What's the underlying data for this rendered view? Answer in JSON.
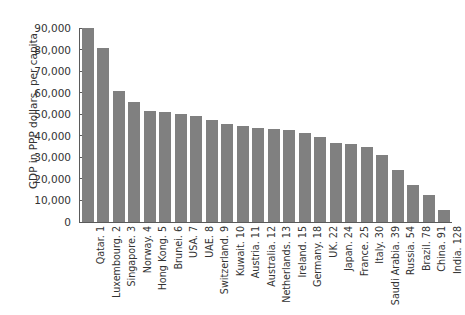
{
  "chart_data": {
    "type": "bar",
    "title": "",
    "subtitle": "",
    "xlabel": "",
    "ylabel": "GDP in PPP dollars, per capita",
    "ylim": [
      0,
      90000
    ],
    "yticks": [
      0,
      10000,
      20000,
      30000,
      40000,
      50000,
      60000,
      70000,
      80000,
      90000
    ],
    "ytick_labels": [
      "0",
      "10,000",
      "20,000",
      "30,000",
      "40,000",
      "50,000",
      "60,000",
      "70,000",
      "80,000",
      "90,000"
    ],
    "grid": false,
    "legend": null,
    "bar_color": "#808080",
    "background_color": "#ffffff",
    "axis_color": "#5a5a5a",
    "categories": [
      "Qatar. 1",
      "Luxembourg. 2",
      "Singapore. 3",
      "Norway. 4",
      "Hong Kong. 5",
      "Brunei. 6",
      "USA. 7",
      "UAE. 8",
      "Switzerland. 9",
      "Kuwait. 10",
      "Austria. 11",
      "Australia. 12",
      "Netherlands. 13",
      "Ireland. 15",
      "Germany. 18",
      "UK. 22",
      "Japan. 24",
      "France. 25",
      "Italy. 30",
      "Saudi Arabia. 39",
      "Russia. 54",
      "Brazil. 78",
      "China. 91",
      "India. 128"
    ],
    "values": [
      90000,
      80500,
      61000,
      55500,
      51500,
      51000,
      50000,
      49000,
      47500,
      45500,
      44500,
      43500,
      43000,
      42500,
      41500,
      39500,
      36500,
      36000,
      35000,
      31000,
      24000,
      17000,
      12500,
      5500
    ]
  }
}
